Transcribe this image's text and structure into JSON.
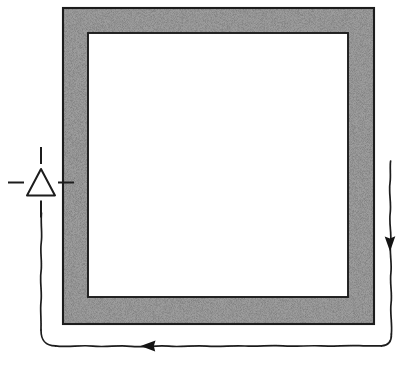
{
  "figure": {
    "kind": "technical-line-drawing",
    "title": "",
    "caption": "",
    "background_color": "#ffffff",
    "ink_color": "#1a1a1a",
    "canvas": {
      "width": 409,
      "height": 369
    }
  },
  "frame": {
    "name": "stippled-square-frame",
    "shape": "square",
    "fill_style": "stipple-speckle",
    "fill_color": "#8a8a8a",
    "outline_color": "#1c1c1c",
    "interior_color": "#ffffff",
    "outer": {
      "x": 63,
      "y": 8,
      "width": 311,
      "height": 316
    },
    "inner": {
      "x": 88,
      "y": 33,
      "width": 260,
      "height": 264
    },
    "band_thickness": 25,
    "label": ""
  },
  "symbol": {
    "name": "triangle-crosshair-symbol",
    "glyph": "triangle-up",
    "filled": false,
    "center": {
      "x": 41,
      "y": 183
    },
    "triangle": {
      "width": 28,
      "height": 27
    },
    "dashes": [
      {
        "direction": "up",
        "length": 17
      },
      {
        "direction": "down",
        "length": 17
      },
      {
        "direction": "left",
        "length": 16
      },
      {
        "direction": "right",
        "length": 16
      }
    ],
    "label": ""
  },
  "wires": [
    {
      "name": "left-wire",
      "orientation": "vertical",
      "from": {
        "x": 41,
        "y": 213
      },
      "to": {
        "x": 41,
        "y": 330
      },
      "style": "hand-drawn-wavy",
      "arrow": null
    },
    {
      "name": "bottom-wire",
      "orientation": "horizontal",
      "from": {
        "x": 55,
        "y": 346
      },
      "to": {
        "x": 381,
        "y": 346
      },
      "style": "hand-drawn-wavy",
      "arrow": {
        "direction": "left",
        "x": 148,
        "y": 346
      }
    },
    {
      "name": "right-wire",
      "orientation": "vertical",
      "from": {
        "x": 391,
        "y": 161
      },
      "to": {
        "x": 391,
        "y": 334
      },
      "style": "hand-drawn-wavy",
      "arrow": {
        "direction": "down",
        "x": 390,
        "y": 243
      }
    }
  ],
  "corners": [
    {
      "name": "bottom-left-corner",
      "x": 41,
      "y": 346,
      "radius": 14
    },
    {
      "name": "bottom-right-corner",
      "x": 391,
      "y": 346,
      "radius": 12
    }
  ],
  "annotations": []
}
